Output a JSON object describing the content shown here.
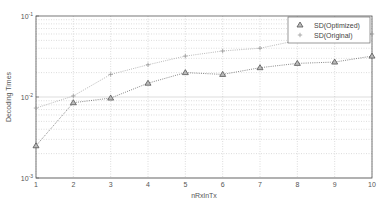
{
  "chart_data": {
    "type": "line",
    "title": "",
    "xlabel": "nRxlnTx",
    "ylabel": "Decoding Times",
    "x": [
      1,
      2,
      3,
      4,
      5,
      6,
      7,
      8,
      9,
      10
    ],
    "xlim": [
      1,
      10
    ],
    "ylim": [
      0.001,
      0.1
    ],
    "yscale": "log",
    "x_ticks": [
      "1",
      "2",
      "3",
      "4",
      "5",
      "6",
      "7",
      "8",
      "9",
      "10"
    ],
    "y_ticks": [
      {
        "base": "10",
        "exp": "-3",
        "value": 0.001
      },
      {
        "base": "10",
        "exp": "-2",
        "value": 0.01
      },
      {
        "base": "10",
        "exp": "-1",
        "value": 0.1
      }
    ],
    "grid": true,
    "legend_position": "upper right",
    "series": [
      {
        "name": "SD(Optimized)",
        "marker": "triangle",
        "color": "#555555",
        "values": [
          0.0025,
          0.0085,
          0.0097,
          0.0148,
          0.02,
          0.019,
          0.023,
          0.026,
          0.027,
          0.032
        ]
      },
      {
        "name": "SD(Original)",
        "marker": "plus",
        "color": "#999999",
        "values": [
          0.0073,
          0.0103,
          0.019,
          0.025,
          0.032,
          0.037,
          0.04,
          0.05,
          0.055,
          0.06
        ]
      }
    ]
  },
  "colors": {
    "axis": "#555555",
    "grid": "#bbbbbb",
    "background": "#ffffff"
  }
}
